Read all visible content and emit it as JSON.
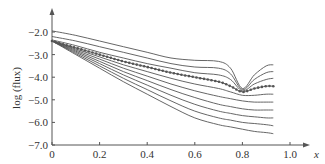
{
  "chart_data": {
    "type": "line",
    "title": "",
    "xlabel": "x",
    "ylabel": "log (flux)",
    "xlim": [
      0,
      1.05
    ],
    "ylim": [
      -7.0,
      -1.5
    ],
    "x_ticks": [
      "0",
      "0.2",
      "0.4",
      "0.6",
      "0.8",
      "1.0"
    ],
    "y_ticks": [
      "-2.0",
      "-3.0",
      "-4.0",
      "-5.0",
      "-6.0",
      "-7.0"
    ],
    "grid": false,
    "legend": null,
    "x": [
      0,
      0.1,
      0.2,
      0.3,
      0.4,
      0.5,
      0.6,
      0.7,
      0.75,
      0.8,
      0.85,
      0.9,
      0.93
    ],
    "series": [
      {
        "name": "curve-1",
        "style": "solid",
        "values": [
          -1.95,
          -2.15,
          -2.4,
          -2.65,
          -2.9,
          -3.15,
          -3.25,
          -3.3,
          -3.6,
          -4.5,
          -3.9,
          -3.5,
          -3.45
        ]
      },
      {
        "name": "curve-2",
        "style": "solid",
        "values": [
          -2.2,
          -2.4,
          -2.65,
          -2.9,
          -3.15,
          -3.4,
          -3.55,
          -3.6,
          -3.85,
          -4.55,
          -4.1,
          -3.8,
          -3.75
        ]
      },
      {
        "name": "curve-3",
        "style": "solid",
        "values": [
          -2.35,
          -2.6,
          -2.9,
          -3.15,
          -3.4,
          -3.6,
          -3.8,
          -3.9,
          -4.1,
          -4.6,
          -4.3,
          -4.1,
          -4.05
        ]
      },
      {
        "name": "curve-dotted",
        "style": "dotted-markers",
        "values": [
          -2.4,
          -2.7,
          -3.0,
          -3.3,
          -3.55,
          -3.8,
          -4.0,
          -4.2,
          -4.4,
          -4.65,
          -4.5,
          -4.4,
          -4.4
        ]
      },
      {
        "name": "curve-5",
        "style": "solid",
        "values": [
          -2.4,
          -2.75,
          -3.1,
          -3.45,
          -3.75,
          -4.05,
          -4.3,
          -4.5,
          -4.65,
          -4.8,
          -4.8,
          -4.75,
          -4.75
        ]
      },
      {
        "name": "curve-6",
        "style": "solid",
        "values": [
          -2.4,
          -2.8,
          -3.2,
          -3.6,
          -3.95,
          -4.3,
          -4.6,
          -4.85,
          -4.95,
          -5.05,
          -5.1,
          -5.1,
          -5.1
        ]
      },
      {
        "name": "curve-7",
        "style": "solid",
        "values": [
          -2.4,
          -2.85,
          -3.3,
          -3.75,
          -4.15,
          -4.55,
          -4.9,
          -5.2,
          -5.3,
          -5.4,
          -5.45,
          -5.45,
          -5.45
        ]
      },
      {
        "name": "curve-8",
        "style": "solid",
        "values": [
          -2.4,
          -2.9,
          -3.4,
          -3.9,
          -4.35,
          -4.8,
          -5.2,
          -5.5,
          -5.6,
          -5.7,
          -5.75,
          -5.8,
          -5.8
        ]
      },
      {
        "name": "curve-9",
        "style": "solid",
        "values": [
          -2.4,
          -2.95,
          -3.5,
          -4.05,
          -4.55,
          -5.05,
          -5.5,
          -5.8,
          -5.9,
          -6.0,
          -6.05,
          -6.1,
          -6.15
        ]
      },
      {
        "name": "curve-10",
        "style": "solid",
        "values": [
          -2.4,
          -3.0,
          -3.6,
          -4.2,
          -4.75,
          -5.3,
          -5.8,
          -6.1,
          -6.2,
          -6.3,
          -6.4,
          -6.45,
          -6.5
        ]
      }
    ]
  },
  "axes": {
    "xlabel": "x",
    "ylabel": "log (flux)",
    "x_ticks": [
      "0",
      "0.2",
      "0.4",
      "0.6",
      "0.8",
      "1.0"
    ],
    "y_ticks": [
      "-2.0",
      "-3.0",
      "-4.0",
      "-5.0",
      "-6.0",
      "-7.0"
    ]
  }
}
